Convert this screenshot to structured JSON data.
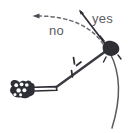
{
  "figure": {
    "background_color": "#ffffff",
    "ink_color": "#3a3a42",
    "label_color": "#5c5c63",
    "width": 132,
    "height": 133
  },
  "labels": {
    "yes": "yes",
    "no": "no"
  },
  "annotations": {
    "yes_arrow": {
      "name": "solid-arrow-yes",
      "style": "solid",
      "direction": "up-left",
      "from": [
        108,
        48
      ],
      "to": [
        79,
        10
      ],
      "meaning": "correct swing direction"
    },
    "no_arrow": {
      "name": "dashed-curved-arrow-no",
      "style": "dashed",
      "direction": "left",
      "from": [
        104,
        45
      ],
      "to": [
        33,
        17
      ],
      "meaning": "incorrect swing direction"
    },
    "tick_mark": {
      "name": "motion-tick-mark",
      "position": [
        73,
        67
      ],
      "meaning": "movement indicator on shaft"
    },
    "pivot": {
      "name": "pivot-joint",
      "position": [
        110,
        49
      ],
      "shape": "dark-blob"
    },
    "arc": {
      "name": "swing-arc",
      "from": [
        110,
        52
      ],
      "to": [
        112,
        128
      ],
      "meaning": "path of swing"
    },
    "hand": {
      "name": "hand-grip",
      "position": [
        22,
        90
      ],
      "meaning": "hand gripping the handle"
    },
    "handle": {
      "name": "tool-handle",
      "from": [
        30,
        90
      ],
      "to": [
        55,
        88
      ]
    },
    "shaft": {
      "name": "tool-shaft",
      "from": [
        55,
        88
      ],
      "to": [
        108,
        50
      ]
    }
  }
}
